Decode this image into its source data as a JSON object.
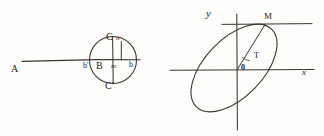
{
  "figure": {
    "ink_color": "#262320",
    "background_color": "#fdfdfc",
    "panels": [
      {
        "id": "left",
        "description": "Horizontal ray from A meeting a circle centered at B",
        "labels": {
          "A": "A",
          "C_top": "C",
          "n": "n",
          "b_prime": "b'",
          "B": "B",
          "m": "m",
          "b_right": "b",
          "C_bottom": "C'"
        },
        "geometry": {
          "circle_center_x": 113,
          "circle_center_y": 60,
          "circle_radius": 24,
          "baseline_y": 60,
          "baseline_start_x": 22,
          "baseline_end_x": 140,
          "chord_x": 121
        }
      },
      {
        "id": "right",
        "description": "Tilted ellipse centered at origin with point M and angle T",
        "labels": {
          "y_axis": "y",
          "x_axis": "x",
          "origin": "0",
          "point_M": "M",
          "angle_T": "T"
        },
        "geometry": {
          "origin_x": 75,
          "origin_y": 70,
          "x_axis_start": 8,
          "x_axis_end": 152,
          "y_axis_top": 14,
          "y_axis_bottom": 130,
          "ellipse_cx": 72,
          "ellipse_cy": 68,
          "ellipse_rx": 54,
          "ellipse_ry": 29,
          "ellipse_rotation_deg": -46,
          "point_M_x": 103,
          "point_M_y": 24,
          "horizontal_guide_y": 24,
          "horizontal_guide_end_x": 150
        }
      }
    ]
  }
}
